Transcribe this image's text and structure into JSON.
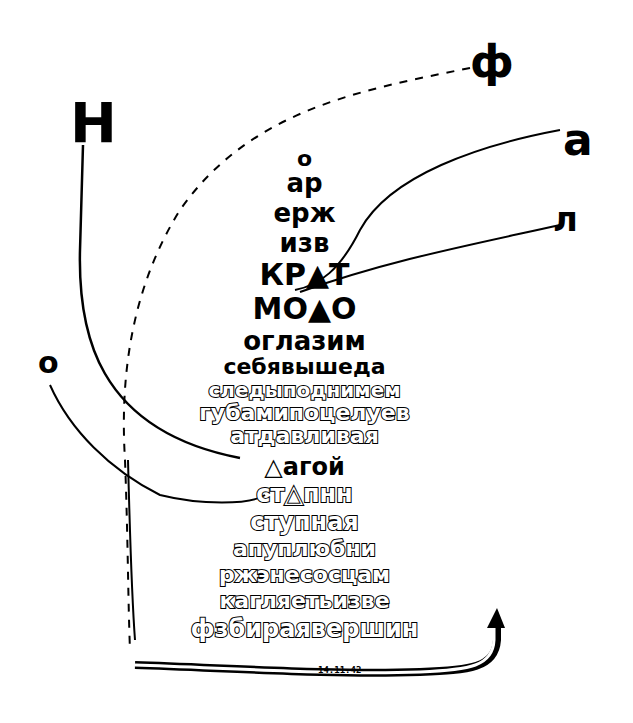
{
  "corner_letters": {
    "top_left": "Н",
    "top_right": "ф",
    "right_upper": "а",
    "right_lower": "л",
    "left_middle": "о"
  },
  "rows": [
    {
      "text": "о",
      "style": "solid",
      "y": 148,
      "size": 22
    },
    {
      "text": "ар",
      "style": "solid",
      "y": 170,
      "size": 26
    },
    {
      "text": "ерж",
      "style": "solid",
      "y": 200,
      "size": 26
    },
    {
      "text": "изв",
      "style": "solid",
      "y": 230,
      "size": 26
    },
    {
      "text": "КР▲Т",
      "style": "solid",
      "y": 260,
      "size": 30
    },
    {
      "text": "МО▲О",
      "style": "solid",
      "y": 294,
      "size": 30
    },
    {
      "text": "оглазим",
      "style": "solid",
      "y": 328,
      "size": 26
    },
    {
      "text": "себявышеда",
      "style": "solid",
      "y": 356,
      "size": 22
    },
    {
      "text": "следыподнимем",
      "style": "outline",
      "y": 380,
      "size": 20
    },
    {
      "text": "губамипоцелуев",
      "style": "outline",
      "y": 402,
      "size": 22
    },
    {
      "text": "атдавливая",
      "style": "outline",
      "y": 425,
      "size": 22
    },
    {
      "text": "△агой",
      "style": "solid",
      "y": 455,
      "size": 24
    },
    {
      "text": "ст△пнн",
      "style": "outline",
      "y": 482,
      "size": 24
    },
    {
      "text": "ступная",
      "style": "outline",
      "y": 510,
      "size": 24
    },
    {
      "text": "апуплюбни",
      "style": "outline",
      "y": 538,
      "size": 22
    },
    {
      "text": "ржэнесосцам",
      "style": "outline",
      "y": 564,
      "size": 22
    },
    {
      "text": "кагляетьизве",
      "style": "outline",
      "y": 590,
      "size": 22
    },
    {
      "text": "фзбираявершин",
      "style": "outline",
      "y": 617,
      "size": 24
    }
  ],
  "bottom_band_text": "14.11.42"
}
